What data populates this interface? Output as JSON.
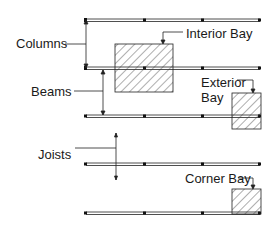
{
  "diagram": {
    "labels": {
      "columns": "Columns",
      "beams": "Beams",
      "joists": "Joists",
      "interior_bay": "Interior Bay",
      "exterior_bay_line1": "Exterior",
      "exterior_bay_line2": "Bay",
      "corner_bay": "Corner Bay"
    },
    "colors": {
      "line": "#1a1a1a",
      "background": "#ffffff"
    }
  }
}
